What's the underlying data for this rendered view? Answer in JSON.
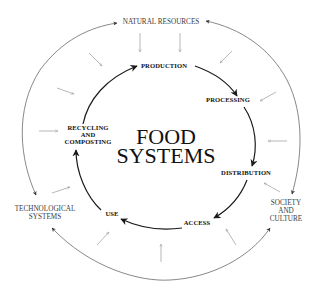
{
  "diagram": {
    "title_line1": "FOOD",
    "title_line2": "SYSTEMS",
    "outer_drivers": {
      "top": "NATURAL RESOURCES",
      "left_line1": "TECHNOLOGICAL",
      "left_line2": "SYSTEMS",
      "right_line1": "SOCIETY",
      "right_line2": "AND",
      "right_line3": "CULTURE"
    },
    "stages": [
      {
        "label": "PRODUCTION"
      },
      {
        "label": "PROCESSING"
      },
      {
        "label": "DISTRIBUTION"
      },
      {
        "label": "ACCESS"
      },
      {
        "label": "USE"
      },
      {
        "label_line1": "RECYCLING",
        "label_line2": "AND",
        "label_line3": "COMPOSTING"
      }
    ],
    "colors": {
      "cycle_arrows": "#1a1a1a",
      "outer_ring": "#555555",
      "inflow_arrows": "#9a9a9a",
      "text": "#111111"
    }
  }
}
